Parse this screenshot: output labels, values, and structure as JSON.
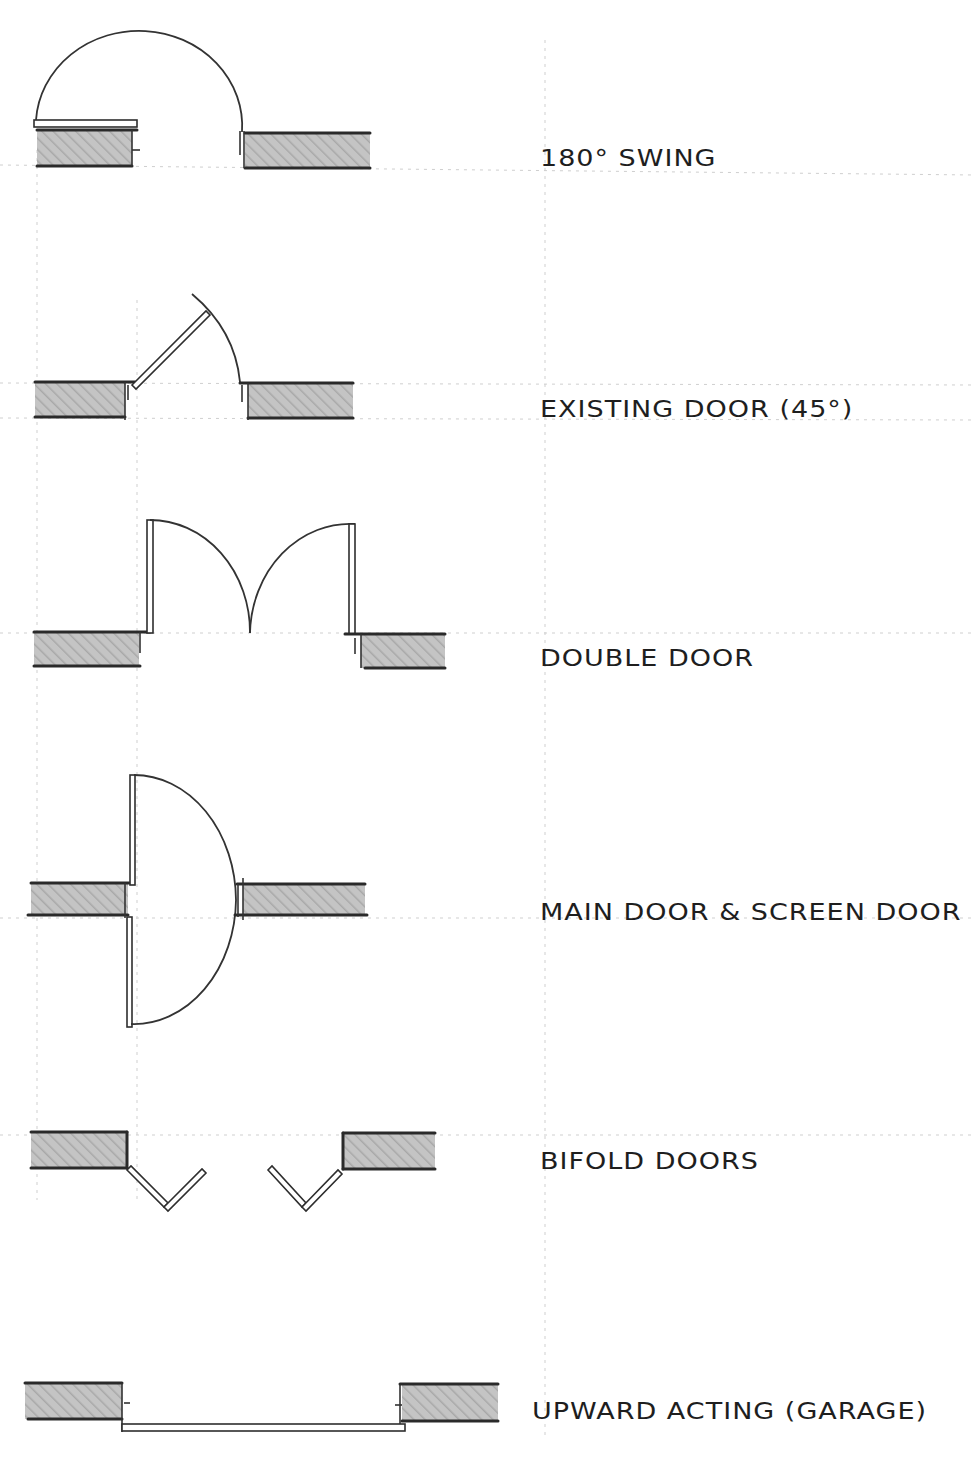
{
  "diagram": {
    "colors": {
      "ink": "#2a2a2a",
      "wall_fill": "#b8b8b8",
      "background": "#ffffff"
    },
    "entries": [
      {
        "id": "swing-180",
        "label": "180° SWING"
      },
      {
        "id": "existing-45",
        "label": "EXISTING DOOR (45°)"
      },
      {
        "id": "double",
        "label": "DOUBLE DOOR"
      },
      {
        "id": "main-screen",
        "label": "MAIN DOOR & SCREEN DOOR"
      },
      {
        "id": "bifold",
        "label": "BIFOLD DOORS"
      },
      {
        "id": "garage",
        "label": "UPWARD ACTING (GARAGE)"
      }
    ]
  }
}
